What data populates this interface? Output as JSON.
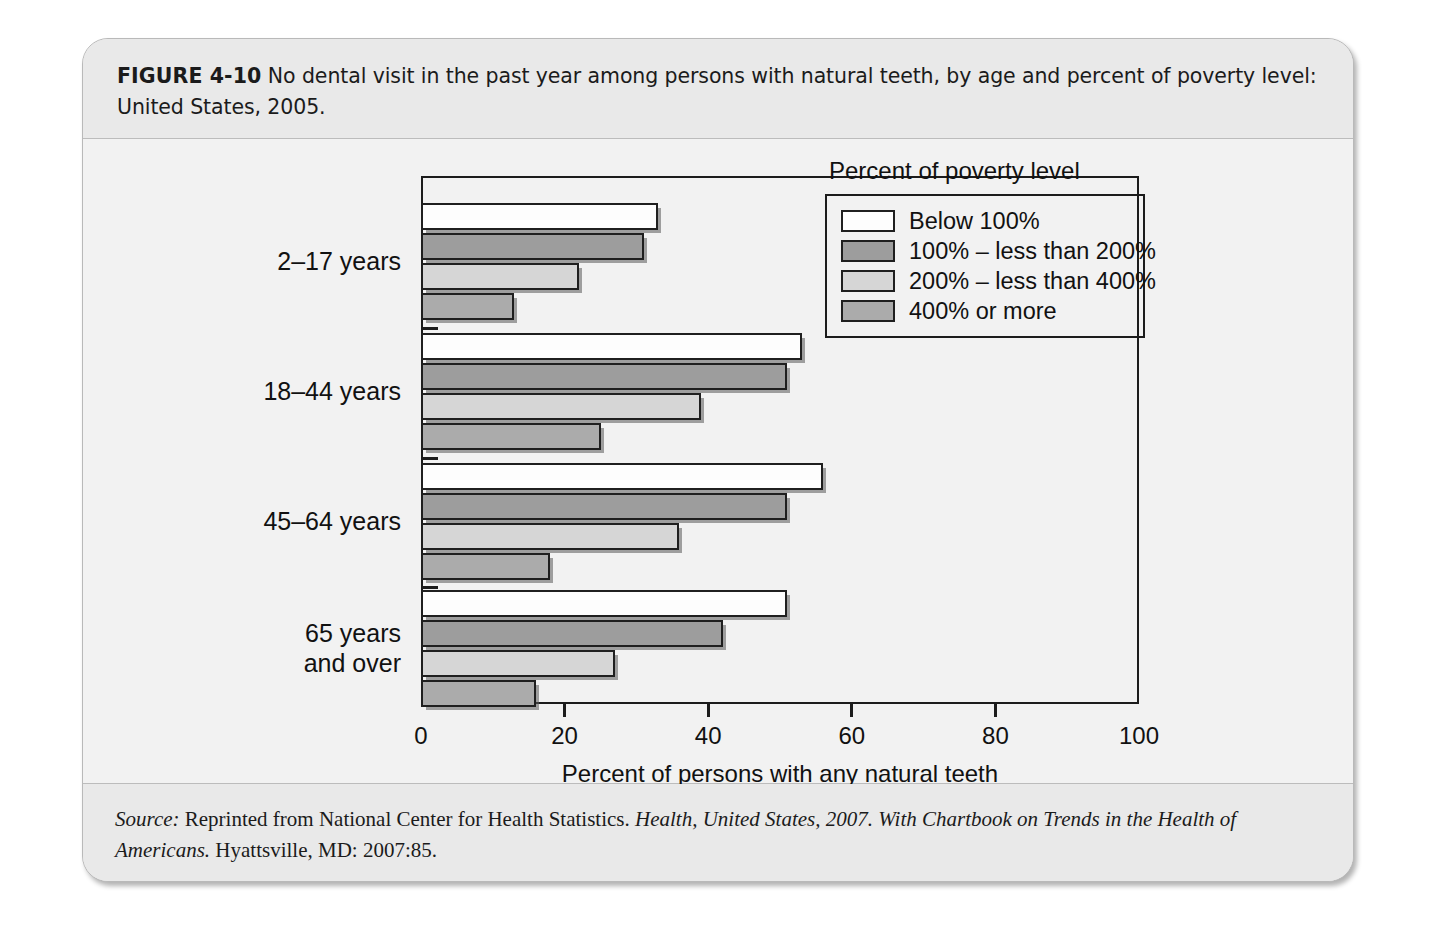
{
  "figure": {
    "label": "FIGURE 4-10",
    "caption": "No dental visit in the past year among persons with natural teeth, by age and percent of poverty level: United States, 2005.",
    "source_prefix": "Source:",
    "source_part1": " Reprinted from National Center for Health Statistics. ",
    "source_italic1": "Health, United States, 2007. With Chartbook on Trends in the Health of Americans.",
    "source_part2": " Hyattsville, MD: 2007:85."
  },
  "chart_data": {
    "type": "bar",
    "orientation": "horizontal",
    "title": "No dental visit in the past year among persons with natural teeth, by age and percent of poverty level: United States, 2005.",
    "xlabel": "Percent of persons with any natural teeth",
    "ylabel": "",
    "xlim": [
      0,
      100
    ],
    "xticks": [
      0,
      20,
      40,
      60,
      80,
      100
    ],
    "xticklabels": [
      "0",
      "20",
      "40",
      "60",
      "80",
      "100"
    ],
    "grid": false,
    "legend_position": "upper right",
    "legend_title": "Percent of poverty level",
    "categories": [
      "2–17 years",
      "18–44 years",
      "45–64 years",
      "65 years and over"
    ],
    "category_lines": [
      [
        "2–17 years"
      ],
      [
        "18–44 years"
      ],
      [
        "45–64 years"
      ],
      [
        "65 years",
        "and over"
      ]
    ],
    "series": [
      {
        "name": "Below 100%",
        "color": "#fdfdfd",
        "values": [
          33,
          53,
          56,
          51
        ]
      },
      {
        "name": "100% – less than 200%",
        "color": "#9d9d9d",
        "values": [
          31,
          51,
          51,
          42
        ]
      },
      {
        "name": "200% – less than 400%",
        "color": "#d6d6d6",
        "values": [
          22,
          39,
          36,
          27
        ]
      },
      {
        "name": "400% or more",
        "color": "#ababab",
        "values": [
          13,
          25,
          18,
          16
        ]
      }
    ]
  },
  "colors": {
    "card_border": "#b9b9b9",
    "header_band": "#e9e9e9",
    "plot_background": "#f2f2f2",
    "axis": "#1c1c1c",
    "text": "#111111"
  }
}
